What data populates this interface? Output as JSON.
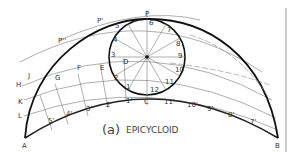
{
  "figure": {
    "caption_prefix": "(a)",
    "caption_title": "EPICYCLOID",
    "colors": {
      "ink": "#222222",
      "thin": "#888888",
      "bg": "#ffffff"
    }
  },
  "labels": {
    "P": "P",
    "P1": "P'",
    "P2": "P''",
    "C": "C",
    "A": "A",
    "B": "B",
    "D": "D",
    "E": "E",
    "F": "F",
    "G": "G",
    "H": "H",
    "J": "J",
    "K": "K",
    "L": "L",
    "circle_divisions": [
      "1",
      "2",
      "3",
      "4",
      "5",
      "6",
      "7",
      "8",
      "9",
      "10",
      "11",
      "12"
    ],
    "left_base_marks": [
      "1'",
      "2'",
      "3'",
      "4'",
      "5'"
    ],
    "right_base_marks": [
      "11'",
      "10'",
      "9'",
      "8'",
      "7'"
    ]
  }
}
